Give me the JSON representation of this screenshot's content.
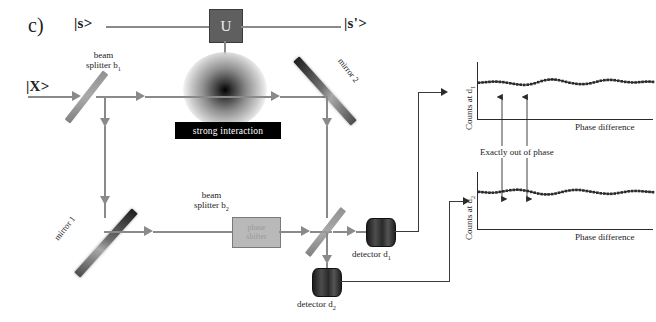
{
  "figure": {
    "panel_label": "c)",
    "caption_text": "Mach-Zehnder interferometer with strong interaction"
  },
  "quantum_rail": {
    "input_state": "|s>",
    "output_state": "|s'>",
    "gate_label": "U"
  },
  "optics": {
    "photon_input": "|X>",
    "beam_splitter_1": "beam\nsplitter b₁",
    "beam_splitter_1_line1": "beam",
    "beam_splitter_1_line2": "splitter b",
    "beam_splitter_1_sub": "1",
    "beam_splitter_2_line1": "beam",
    "beam_splitter_2_line2": "splitter b",
    "beam_splitter_2_sub": "2",
    "mirror_1": "mirror 1",
    "mirror_2": "mirror 2",
    "interaction_label": "strong interaction",
    "phase_shifter_line1": "phase",
    "phase_shifter_line2": "shifter",
    "detector_1": "detector d",
    "detector_1_sub": "1",
    "detector_2": "detector d",
    "detector_2_sub": "2"
  },
  "annotations": {
    "out_of_phase": "Exactly out of phase"
  },
  "colors": {
    "beam": "#8a8a8a",
    "wire": "#3a3a3a",
    "mirror_dark": "#1d1d1d",
    "interaction_box": "#000000",
    "gate_fill": "#5f5f5f",
    "phase_shifter_fill": "#b9b9b9",
    "marker": "#2b2b2b"
  },
  "chart_data": [
    {
      "type": "line",
      "name": "counts-at-d1",
      "title": "",
      "ylabel": "Counts at d",
      "ylabel_sub": "1",
      "xlabel": "Phase difference",
      "grid": false,
      "legend": "none",
      "marker": "square",
      "xlim": [
        0,
        100
      ],
      "ylim": [
        0,
        10
      ],
      "x": [
        0,
        2,
        4,
        6,
        8,
        10,
        12,
        14,
        16,
        18,
        20,
        22,
        24,
        26,
        28,
        30,
        32,
        34,
        36,
        38,
        40,
        42,
        44,
        46,
        48,
        50,
        52,
        54,
        56,
        58,
        60,
        62,
        64,
        66,
        68,
        70,
        72,
        74,
        76,
        78,
        80,
        82,
        84,
        86,
        88,
        90,
        92,
        94,
        96,
        98,
        100
      ],
      "values": [
        6.3,
        6.35,
        6.4,
        6.45,
        6.5,
        6.5,
        6.45,
        6.4,
        6.3,
        6.2,
        6.1,
        6.0,
        5.95,
        5.9,
        5.95,
        6.05,
        6.2,
        6.4,
        6.6,
        6.75,
        6.85,
        6.9,
        6.85,
        6.75,
        6.6,
        6.45,
        6.3,
        6.2,
        6.1,
        6.05,
        6.05,
        6.1,
        6.2,
        6.35,
        6.5,
        6.65,
        6.75,
        6.8,
        6.8,
        6.75,
        6.65,
        6.55,
        6.45,
        6.4,
        6.35,
        6.35,
        6.4,
        6.45,
        6.5,
        6.5,
        6.45
      ],
      "annotation_arrows": [
        {
          "x": 22,
          "label": "minimum-d1"
        },
        {
          "x": 42,
          "label": "maximum-d1"
        }
      ]
    },
    {
      "type": "line",
      "name": "counts-at-d2",
      "title": "",
      "ylabel": "Counts at d",
      "ylabel_sub": "2",
      "xlabel": "Phase difference",
      "grid": false,
      "legend": "none",
      "marker": "square",
      "xlim": [
        0,
        100
      ],
      "ylim": [
        0,
        10
      ],
      "x": [
        0,
        2,
        4,
        6,
        8,
        10,
        12,
        14,
        16,
        18,
        20,
        22,
        24,
        26,
        28,
        30,
        32,
        34,
        36,
        38,
        40,
        42,
        44,
        46,
        48,
        50,
        52,
        54,
        56,
        58,
        60,
        62,
        64,
        66,
        68,
        70,
        72,
        74,
        76,
        78,
        80,
        82,
        84,
        86,
        88,
        90,
        92,
        94,
        96,
        98,
        100
      ],
      "values": [
        6.45,
        6.4,
        6.35,
        6.3,
        6.3,
        6.35,
        6.45,
        6.55,
        6.65,
        6.75,
        6.8,
        6.85,
        6.8,
        6.7,
        6.6,
        6.45,
        6.3,
        6.15,
        6.05,
        6.0,
        6.0,
        6.05,
        6.15,
        6.3,
        6.45,
        6.6,
        6.7,
        6.78,
        6.8,
        6.78,
        6.7,
        6.6,
        6.5,
        6.4,
        6.3,
        6.2,
        6.15,
        6.1,
        6.1,
        6.15,
        6.25,
        6.35,
        6.45,
        6.55,
        6.6,
        6.62,
        6.6,
        6.55,
        6.5,
        6.45,
        6.4
      ],
      "annotation_arrows": [
        {
          "x": 22,
          "label": "maximum-d2"
        },
        {
          "x": 42,
          "label": "minimum-d2"
        }
      ]
    }
  ]
}
